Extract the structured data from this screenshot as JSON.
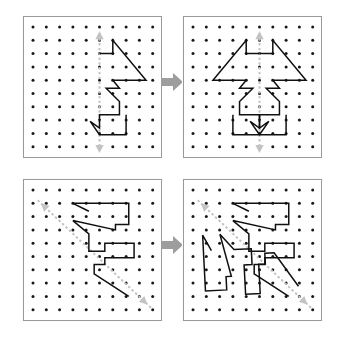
{
  "figure": {
    "background_color": "#ffffff",
    "dot_color": "#181818",
    "shape_stroke_color": "#101010",
    "symmetry_line_color": "#c3c3c3",
    "transition_arrow_color": "#9d9d9d",
    "panel_border_color": "#9a9a9a"
  },
  "grid": {
    "columns": 10,
    "rows": 10,
    "dot_radius": 1.5,
    "origin_x": 9,
    "origin_y": 10,
    "spacing": 13.3
  },
  "examples": [
    {
      "id": "example-1",
      "symmetry_line": {
        "type": "vertical",
        "label": "vertical line of symmetry",
        "x1": 5,
        "y1": 0.4,
        "x2": 5,
        "y2": 9.4,
        "double_headed": true
      },
      "before": {
        "name": "half-figure-vertical",
        "closed": false,
        "points": [
          [
            5.0,
            2.0
          ],
          [
            6.0,
            2.0
          ],
          [
            6.0,
            1.0
          ],
          [
            8.5,
            4.0
          ],
          [
            6.0,
            4.0
          ],
          [
            6.5,
            4.6
          ],
          [
            5.5,
            4.6
          ],
          [
            6.5,
            5.6
          ],
          [
            6.5,
            6.6
          ],
          [
            5.0,
            6.6
          ],
          [
            5.0,
            7.6
          ],
          [
            4.3,
            7.1
          ],
          [
            5.0,
            8.1
          ],
          [
            7.0,
            8.1
          ],
          [
            7.0,
            6.6
          ]
        ]
      },
      "after": {
        "name": "completed-figure-vertical",
        "mirrored": true,
        "closed": false
      }
    },
    {
      "id": "example-2",
      "symmetry_line": {
        "type": "diagonal",
        "label": "diagonal line of symmetry",
        "x1": 8.6,
        "y1": 8.6,
        "x2": 0.6,
        "y2": 1.0,
        "double_headed": true
      },
      "before": {
        "name": "half-figure-diagonal",
        "closed": false,
        "points": [
          [
            4.2,
            1.6
          ],
          [
            3.0,
            1.0
          ],
          [
            4.6,
            1.0
          ],
          [
            7.2,
            1.0
          ],
          [
            7.2,
            2.6
          ],
          [
            6.2,
            2.6
          ],
          [
            6.2,
            3.0
          ],
          [
            3.0,
            2.3
          ],
          [
            4.2,
            3.3
          ],
          [
            4.2,
            4.6
          ],
          [
            5.4,
            4.6
          ],
          [
            5.4,
            4.0
          ],
          [
            7.6,
            4.0
          ],
          [
            7.6,
            5.1
          ],
          [
            5.4,
            5.1
          ],
          [
            5.4,
            5.6
          ],
          [
            4.6,
            5.6
          ],
          [
            4.6,
            6.3
          ],
          [
            7.2,
            8.0
          ]
        ]
      },
      "after": {
        "name": "completed-figure-diagonal",
        "mirrored": true,
        "closed": false
      }
    }
  ],
  "transition_arrows": [
    {
      "name": "arrow-example-1",
      "direction": "right"
    },
    {
      "name": "arrow-example-2",
      "direction": "right"
    }
  ]
}
